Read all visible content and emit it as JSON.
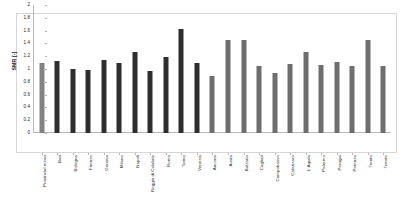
{
  "chart_data": {
    "type": "bar",
    "title": "",
    "xlabel": "",
    "ylabel": "SMR [-]",
    "ylim": [
      0,
      2
    ],
    "ytick_labels": [
      "0",
      "0.2",
      "0.4",
      "0.6",
      "0.8",
      "1",
      "1.2",
      "1.4",
      "1.6",
      "1.8",
      "2"
    ],
    "ytick_values": [
      0,
      0.2,
      0.4,
      0.6,
      0.8,
      1.0,
      1.2,
      1.4,
      1.6,
      1.8,
      2.0
    ],
    "grid": false,
    "legend": "none",
    "categories": [
      "Provincial mean",
      "Bari",
      "Bologna",
      "Firenze",
      "Genova",
      "Milano",
      "Napoli",
      "Reggio di Calabria",
      "Roma",
      "Torino",
      "Venezia",
      "Ancona",
      "Aosta",
      "Bolzano",
      "Cagliari",
      "Campobasso",
      "Catanzaro",
      "L'Aquila",
      "Palermo",
      "Perugia",
      "Potenza",
      "Trento",
      "Trieste"
    ],
    "values": [
      1.09,
      1.12,
      1.0,
      0.99,
      1.14,
      1.09,
      1.27,
      0.97,
      1.18,
      1.63,
      1.09,
      0.89,
      1.45,
      1.45,
      1.05,
      0.94,
      1.08,
      1.26,
      1.06,
      1.11,
      1.04,
      1.45,
      1.05
    ],
    "bar_groups": [
      "mean",
      "metro",
      "metro",
      "metro",
      "metro",
      "metro",
      "metro",
      "metro",
      "metro",
      "metro",
      "metro",
      "other",
      "other",
      "other",
      "other",
      "other",
      "other",
      "other",
      "other",
      "other",
      "other",
      "other",
      "other"
    ],
    "colors": {
      "mean": "#838383",
      "metro": "#2e2e2e",
      "other": "#6e6e6e",
      "axis": "#b8b8b8",
      "frame": "#d6d6d6",
      "background": "#ffffff",
      "text": "#262626"
    }
  }
}
